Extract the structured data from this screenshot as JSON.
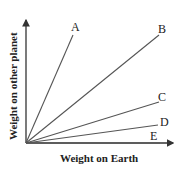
{
  "diagram": {
    "x_axis_label": "Weight on Earth",
    "y_axis_label": "Weight on other planet",
    "lines": [
      {
        "label": "A",
        "x2": 73,
        "y2": 35,
        "lx": 71,
        "ly": 31
      },
      {
        "label": "B",
        "x2": 159,
        "y2": 35,
        "lx": 158,
        "ly": 33
      },
      {
        "label": "C",
        "x2": 159,
        "y2": 102,
        "lx": 158,
        "ly": 101
      },
      {
        "label": "D",
        "x2": 158,
        "y2": 125,
        "lx": 160,
        "ly": 126
      },
      {
        "label": "E",
        "x2": 160,
        "y2": 143,
        "lx": 150,
        "ly": 140
      }
    ],
    "colors": {
      "line": "#555555",
      "axis": "#333333",
      "text": "#222222"
    }
  }
}
